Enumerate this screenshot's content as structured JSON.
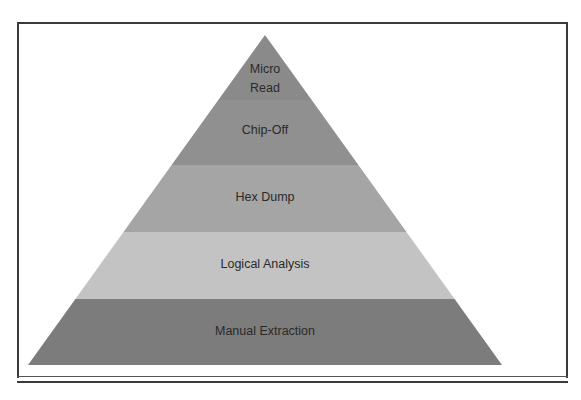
{
  "diagram": {
    "type": "pyramid",
    "layers": [
      {
        "label_lines": [
          "Micro",
          "Read"
        ],
        "label": "Micro Read",
        "color": "#8a8a8a"
      },
      {
        "label_lines": [
          "Chip-Off"
        ],
        "label": "Chip-Off",
        "color": "#909090"
      },
      {
        "label_lines": [
          "Hex Dump"
        ],
        "label": "Hex Dump",
        "color": "#a5a5a5"
      },
      {
        "label_lines": [
          "Logical Analysis"
        ],
        "label": "Logical Analysis",
        "color": "#c3c3c3"
      },
      {
        "label_lines": [
          "Manual Extraction"
        ],
        "label": "Manual Extraction",
        "color": "#7c7c7c"
      }
    ],
    "text_color": "#2a2a2a",
    "frame_color": "#3a3a3a"
  }
}
